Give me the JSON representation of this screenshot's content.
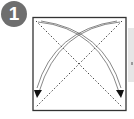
{
  "step": {
    "number": "1",
    "badge_color": "#6e6e6e"
  },
  "diagram": {
    "paper": {
      "x": 33,
      "y": 17,
      "size": 93,
      "border_color": "#333333"
    },
    "valley_folds": [
      "top-left to bottom-right diagonal",
      "top-right to bottom-left diagonal"
    ],
    "arrows": [
      "top-left corner curves to bottom-right",
      "top-right corner curves to bottom-left"
    ],
    "fold_line_style": "dotted",
    "arrow_color": "#444444"
  },
  "side_panel": {
    "color": "#e6e6e6"
  }
}
